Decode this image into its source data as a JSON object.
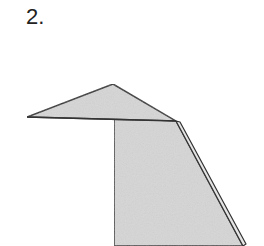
{
  "step": {
    "label": "2."
  },
  "diagram": {
    "fill_color": "#d9d9d9",
    "stroke_color": "#333333",
    "shapes": {
      "top_triangle": [
        [
          27,
          117
        ],
        [
          113,
          84
        ],
        [
          176,
          121
        ]
      ],
      "body": [
        [
          114,
          118
        ],
        [
          176,
          121
        ],
        [
          243,
          246
        ],
        [
          114,
          246
        ]
      ],
      "fold_edge": [
        [
          176,
          121
        ],
        [
          243,
          240
        ],
        [
          245,
          246
        ],
        [
          178,
          124
        ]
      ]
    }
  }
}
